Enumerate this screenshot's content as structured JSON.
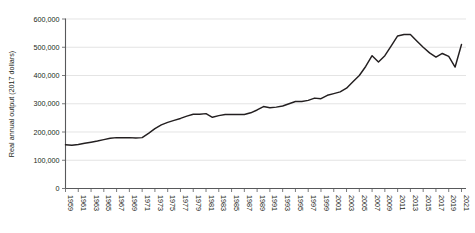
{
  "chart_data": {
    "type": "line",
    "title": "",
    "subtitle": "",
    "xlabel": "",
    "ylabel": "Real annual output (2017 dollars)",
    "ylim": [
      0,
      600000
    ],
    "xlim": [
      1959,
      2021
    ],
    "grid": "horizontal",
    "legend": "none",
    "y_ticks": [
      0,
      100000,
      200000,
      300000,
      400000,
      500000,
      600000
    ],
    "y_tick_labels": [
      "0",
      "100,000",
      "200,000",
      "300,000",
      "400,000",
      "500,000",
      "600,000"
    ],
    "x_tick_labels": [
      "1959",
      "1961",
      "1963",
      "1965",
      "1967",
      "1969",
      "1971",
      "1973",
      "1975",
      "1977",
      "1979",
      "1981",
      "1983",
      "1985",
      "1987",
      "1989",
      "1991",
      "1993",
      "1995",
      "1997",
      "1999",
      "2001",
      "2003",
      "2005",
      "2007",
      "2009",
      "2011",
      "2013",
      "2015",
      "2017",
      "2019",
      "2021"
    ],
    "x_tick_step": 2,
    "series": [
      {
        "name": "Real annual output",
        "color": "#231f20",
        "x": [
          1959,
          1960,
          1961,
          1962,
          1963,
          1964,
          1965,
          1966,
          1967,
          1968,
          1969,
          1970,
          1971,
          1972,
          1973,
          1974,
          1975,
          1976,
          1977,
          1978,
          1979,
          1980,
          1981,
          1982,
          1983,
          1984,
          1985,
          1986,
          1987,
          1988,
          1989,
          1990,
          1991,
          1992,
          1993,
          1994,
          1995,
          1996,
          1997,
          1998,
          1999,
          2000,
          2001,
          2002,
          2003,
          2004,
          2005,
          2006,
          2007,
          2008,
          2009,
          2010,
          2011,
          2012,
          2013,
          2014,
          2015,
          2016,
          2017,
          2018,
          2019,
          2020,
          2021
        ],
        "values": [
          155000,
          153000,
          156000,
          160000,
          164000,
          168000,
          173000,
          178000,
          180000,
          180000,
          180000,
          179000,
          180000,
          195000,
          212000,
          225000,
          234000,
          241000,
          248000,
          256000,
          263000,
          263000,
          265000,
          252000,
          258000,
          262000,
          262000,
          262000,
          262000,
          268000,
          278000,
          290000,
          286000,
          288000,
          292000,
          300000,
          308000,
          308000,
          312000,
          320000,
          318000,
          330000,
          336000,
          342000,
          355000,
          378000,
          400000,
          432000,
          470000,
          448000,
          470000,
          505000,
          540000,
          545000,
          545000,
          522000,
          500000,
          480000,
          465000,
          478000,
          468000,
          430000,
          510000
        ]
      }
    ]
  },
  "axis": {
    "y_axis_title": "Real annual output (2017 dollars)"
  }
}
